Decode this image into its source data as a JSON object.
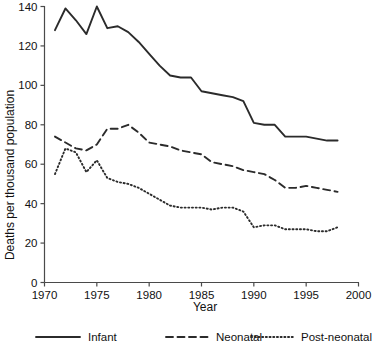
{
  "chart_data": {
    "type": "line",
    "title": "",
    "xlabel": "Year",
    "ylabel": "Deaths per thousand population",
    "xlim": [
      1970,
      2000
    ],
    "ylim": [
      0,
      140
    ],
    "xticks": [
      1970,
      1975,
      1980,
      1985,
      1990,
      1995,
      2000
    ],
    "yticks": [
      0,
      20,
      40,
      60,
      80,
      100,
      120,
      140
    ],
    "grid": false,
    "legend_position": "bottom",
    "x": [
      1971,
      1972,
      1973,
      1974,
      1975,
      1976,
      1977,
      1978,
      1979,
      1980,
      1981,
      1982,
      1983,
      1984,
      1985,
      1986,
      1987,
      1988,
      1989,
      1990,
      1991,
      1992,
      1993,
      1994,
      1995,
      1996,
      1997,
      1998
    ],
    "series": [
      {
        "name": "Infant",
        "style": "solid",
        "color": "#2b2b2b",
        "values": [
          128,
          139,
          133,
          126,
          140,
          129,
          130,
          127,
          122,
          116,
          110,
          105,
          104,
          104,
          97,
          96,
          95,
          94,
          92,
          81,
          80,
          80,
          74,
          74,
          74,
          73,
          72,
          72
        ]
      },
      {
        "name": "Neonatal",
        "style": "dashed",
        "color": "#2b2b2b",
        "values": [
          74,
          71,
          68,
          67,
          70,
          78,
          78,
          80,
          76,
          71,
          70,
          69,
          67,
          66,
          65,
          61,
          60,
          59,
          57,
          56,
          55,
          52,
          48,
          48,
          49,
          48,
          47,
          46
        ]
      },
      {
        "name": "Post-neonatal",
        "style": "dotted",
        "color": "#2b2b2b",
        "values": [
          55,
          68,
          66,
          56,
          62,
          53,
          51,
          50,
          48,
          45,
          42,
          39,
          38,
          38,
          38,
          37,
          38,
          38,
          36,
          28,
          29,
          29,
          27,
          27,
          27,
          26,
          26,
          28
        ]
      }
    ]
  },
  "legend": {
    "items": [
      {
        "label": "Infant",
        "style": "solid"
      },
      {
        "label": "Neonatal",
        "style": "dashed"
      },
      {
        "label": "Post-neonatal",
        "style": "dotted"
      }
    ]
  }
}
